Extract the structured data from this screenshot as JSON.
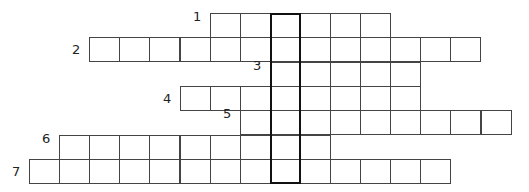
{
  "puzzle": {
    "type": "crossword",
    "grid": {
      "origin_x": 29,
      "origin_y": 13,
      "cell_w": 30.1,
      "cell_h": 24.3
    },
    "highlight_column": {
      "col": 8,
      "row_start": 0,
      "row_end": 6
    },
    "clues": [
      {
        "number": "1",
        "row": 0,
        "start_col": 6,
        "length": 6
      },
      {
        "number": "2",
        "row": 1,
        "start_col": 2,
        "length": 13
      },
      {
        "number": "3",
        "row": 2,
        "start_col": 8,
        "length": 5
      },
      {
        "number": "4",
        "row": 3,
        "start_col": 5,
        "length": 8
      },
      {
        "number": "5",
        "row": 4,
        "start_col": 7,
        "length": 9
      },
      {
        "number": "6",
        "row": 5,
        "start_col": 1,
        "length": 9
      },
      {
        "number": "7",
        "row": 6,
        "start_col": 0,
        "length": 14
      }
    ]
  }
}
